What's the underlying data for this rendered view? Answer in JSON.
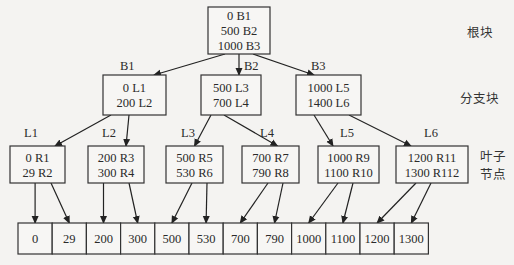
{
  "root": {
    "id": "root",
    "entries": [
      "0 B1",
      "500 B2",
      "1000 B3"
    ]
  },
  "branches": [
    {
      "id": "B1",
      "label": "B1",
      "entries": [
        "0 L1",
        "200 L2"
      ]
    },
    {
      "id": "B2",
      "label": "B2",
      "entries": [
        "500 L3",
        "700 L4"
      ]
    },
    {
      "id": "B3",
      "label": "B3",
      "entries": [
        "1000 L5",
        "1400 L6"
      ]
    }
  ],
  "leaves": [
    {
      "id": "L1",
      "label": "L1",
      "parent": "B1",
      "entries": [
        "0 R1",
        "29 R2"
      ]
    },
    {
      "id": "L2",
      "label": "L2",
      "parent": "B1",
      "entries": [
        "200 R3",
        "300 R4"
      ]
    },
    {
      "id": "L3",
      "label": "L3",
      "parent": "B2",
      "entries": [
        "500 R5",
        "530 R6"
      ]
    },
    {
      "id": "L4",
      "label": "L4",
      "parent": "B2",
      "entries": [
        "700 R7",
        "790 R8"
      ]
    },
    {
      "id": "L5",
      "label": "L5",
      "parent": "B3",
      "entries": [
        "1000 R9",
        "1100 R10"
      ]
    },
    {
      "id": "L6",
      "label": "L6",
      "parent": "B3",
      "entries": [
        "1200 R11",
        "1300 R112"
      ]
    }
  ],
  "data_cells": [
    "0",
    "29",
    "200",
    "300",
    "500",
    "530",
    "700",
    "790",
    "1000",
    "1100",
    "1200",
    "1300"
  ],
  "level_labels": {
    "root": "根块",
    "branch": "分支块",
    "leaf_line1": "叶子",
    "leaf_line2": "节点"
  }
}
